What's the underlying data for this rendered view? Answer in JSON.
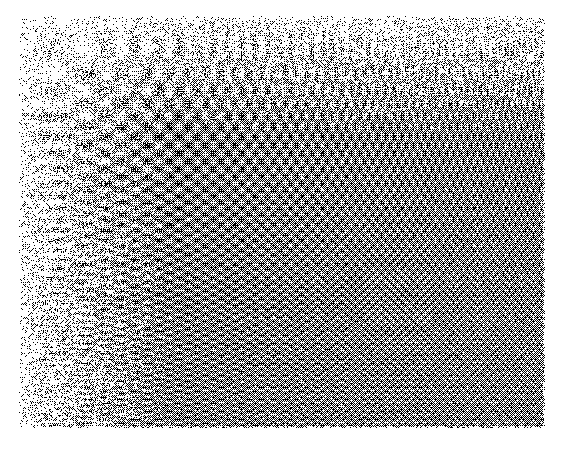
{
  "page": {
    "width": 580,
    "height": 450,
    "background_color": "#ffffff",
    "margin_color": "#ffffff",
    "content_type": "grayscale-test-pattern-image",
    "title": "",
    "caption": "",
    "visible_text": ""
  },
  "figure": {
    "name": "chirp-zone-plate-test-pattern",
    "x": 18,
    "y": 15,
    "width": 528,
    "height": 414,
    "ink_color": "#000000",
    "paper_color": "#ffffff",
    "rendering": "halftone-dither"
  },
  "chart_data": {
    "type": "heatmap",
    "title": "",
    "subtitle": "",
    "xlabel": "",
    "ylabel": "",
    "legend": [],
    "grid": false,
    "colormap": "grayscale",
    "colormap_low": "#ffffff",
    "colormap_high": "#000000",
    "xlim": [
      0,
      1
    ],
    "ylim": [
      0,
      1
    ],
    "x_tick_labels": [],
    "y_tick_labels": [],
    "function": "sin(kx * x^2) * sin(ky * y^2)",
    "params": {
      "kx_cycles_max": 46,
      "ky_cycles_max": 38,
      "x_exponent": 2.0,
      "y_exponent": 2.0,
      "amplitude": 1.0,
      "bias": 0.5,
      "dither": "ordered-bayer-8x8",
      "dither_strength": 0.38,
      "noise_amount": 0.16,
      "paper_grain": 0.05,
      "edge_fade_px": 3
    },
    "sample_grid": {
      "cols": 8,
      "rows": 8,
      "x_positions": [
        0.0625,
        0.1875,
        0.3125,
        0.4375,
        0.5625,
        0.6875,
        0.8125,
        0.9375
      ],
      "y_positions": [
        0.0625,
        0.1875,
        0.3125,
        0.4375,
        0.5625,
        0.6875,
        0.8125,
        0.9375
      ],
      "mean_density": [
        [
          0.18,
          0.31,
          0.44,
          0.49,
          0.5,
          0.5,
          0.5,
          0.5
        ],
        [
          0.34,
          0.42,
          0.47,
          0.5,
          0.5,
          0.5,
          0.5,
          0.5
        ],
        [
          0.46,
          0.48,
          0.49,
          0.5,
          0.5,
          0.5,
          0.5,
          0.5
        ],
        [
          0.49,
          0.5,
          0.5,
          0.5,
          0.5,
          0.5,
          0.5,
          0.5
        ],
        [
          0.5,
          0.5,
          0.5,
          0.5,
          0.5,
          0.5,
          0.5,
          0.5
        ],
        [
          0.5,
          0.5,
          0.5,
          0.5,
          0.5,
          0.5,
          0.5,
          0.5
        ],
        [
          0.5,
          0.5,
          0.5,
          0.5,
          0.5,
          0.5,
          0.5,
          0.5
        ],
        [
          0.5,
          0.5,
          0.5,
          0.5,
          0.5,
          0.5,
          0.5,
          0.5
        ]
      ],
      "local_frequency_cycles_per_100px": [
        [
          0.6,
          1.7,
          2.9,
          4.0,
          5.2,
          6.3,
          7.5,
          8.6
        ],
        [
          1.7,
          2.4,
          3.4,
          4.4,
          5.5,
          6.6,
          7.7,
          8.8
        ],
        [
          2.9,
          3.4,
          4.1,
          5.0,
          5.9,
          6.9,
          8.0,
          9.1
        ],
        [
          4.0,
          4.4,
          5.0,
          5.7,
          6.5,
          7.4,
          8.4,
          9.4
        ],
        [
          5.2,
          5.5,
          5.9,
          6.5,
          7.2,
          8.0,
          8.9,
          9.9
        ],
        [
          6.3,
          6.6,
          6.9,
          7.4,
          8.0,
          8.7,
          9.5,
          10.4
        ],
        [
          7.5,
          7.7,
          8.0,
          8.4,
          8.9,
          9.5,
          10.2,
          11.0
        ],
        [
          8.6,
          8.8,
          9.1,
          9.4,
          9.9,
          10.4,
          11.0,
          11.7
        ]
      ]
    },
    "regions": [
      {
        "name": "top-left-origin",
        "x_range": [
          0.0,
          0.22
        ],
        "y_range": [
          0.0,
          0.22
        ],
        "appearance": "lowest spatial frequency; sparse isolated crescent-shaped halftone blobs on near-white paper",
        "mean_gray": 0.22
      },
      {
        "name": "upper-left-dark-band",
        "x_range": [
          0.02,
          0.3
        ],
        "y_range": [
          0.22,
          0.45
        ],
        "appearance": "dense dark lobes forming the strongest black cluster in the image",
        "mean_gray": 0.62
      },
      {
        "name": "top-right-vertical-stripes",
        "x_range": [
          0.45,
          1.0
        ],
        "y_range": [
          0.0,
          0.25
        ],
        "appearance": "fine vertical striping from high horizontal frequency against low vertical frequency",
        "mean_gray": 0.48
      },
      {
        "name": "bottom-left-horizontal-stripes",
        "x_range": [
          0.0,
          0.3
        ],
        "y_range": [
          0.6,
          1.0
        ],
        "appearance": "fine horizontal striping from high vertical frequency against low horizontal frequency",
        "mean_gray": 0.48
      },
      {
        "name": "bottom-right-aliased-noise",
        "x_range": [
          0.62,
          1.0
        ],
        "y_range": [
          0.58,
          1.0
        ],
        "appearance": "frequency exceeds sampling limit; pattern degenerates into uniform salt-and-pepper noise",
        "mean_gray": 0.5
      }
    ]
  }
}
